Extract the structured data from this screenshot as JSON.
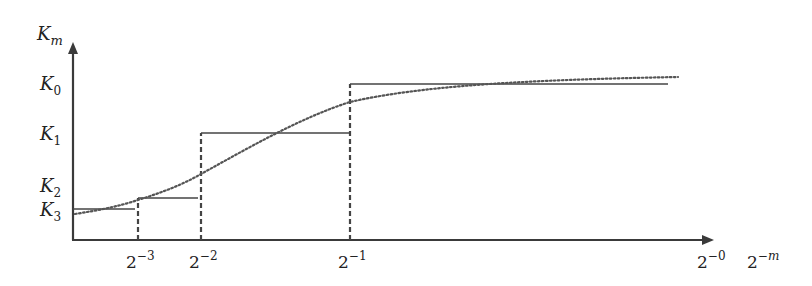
{
  "diagram": {
    "y_axis_label": {
      "base": "K",
      "sub": "m"
    },
    "x_axis_label": {
      "base": "2",
      "sup": "−m"
    },
    "y_ticks": [
      {
        "base": "K",
        "sub": "0",
        "y": 84
      },
      {
        "base": "K",
        "sub": "1",
        "y": 133
      },
      {
        "base": "K",
        "sub": "2",
        "y": 186
      },
      {
        "base": "K",
        "sub": "3",
        "y": 210
      }
    ],
    "x_ticks": [
      {
        "base": "2",
        "sup": "−3",
        "x": 138
      },
      {
        "base": "2",
        "sup": "−2",
        "x": 201
      },
      {
        "base": "2",
        "sup": "−1",
        "x": 350
      },
      {
        "base": "2",
        "sup": "−0",
        "x": 700
      }
    ],
    "steps": [
      {
        "level": "K3",
        "x1": 73,
        "x2": 135,
        "y": 209
      },
      {
        "level": "K2",
        "x1": 138,
        "x2": 198,
        "y": 198
      },
      {
        "level": "K1",
        "x1": 201,
        "x2": 350,
        "y": 133
      },
      {
        "level": "K0",
        "x1": 350,
        "x2": 668,
        "y": 84
      }
    ],
    "colors": {
      "axis": "#3a3a3a",
      "line": "#444444",
      "curve": "#555555"
    }
  }
}
